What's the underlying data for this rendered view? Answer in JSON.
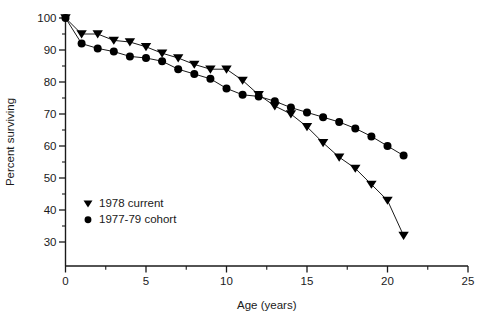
{
  "chart_data": {
    "type": "line",
    "title": "",
    "subtitle": "",
    "xlabel": "Age (years)",
    "ylabel": "Percent surviving",
    "xlim": [
      0,
      25
    ],
    "ylim": [
      25,
      100
    ],
    "grid": false,
    "legend_position": "inside-lower-left",
    "x_ticks_major": [
      0,
      5,
      10,
      15,
      20,
      25
    ],
    "x_tick_labels": [
      "0",
      "5",
      "10",
      "15",
      "20",
      "25"
    ],
    "x_ticks_minor": [
      1,
      2,
      3,
      4,
      6,
      7,
      8,
      9,
      11,
      12,
      13,
      14,
      16,
      17,
      18,
      19,
      21,
      22,
      23,
      24
    ],
    "y_ticks_major": [
      30,
      40,
      50,
      60,
      70,
      80,
      90,
      100
    ],
    "y_tick_labels": [
      "30",
      "40",
      "50",
      "60",
      "70",
      "80",
      "90",
      "100"
    ],
    "y_ticks_minor": [
      35,
      45,
      55,
      65,
      75,
      85,
      95
    ],
    "x": [
      0,
      1,
      2,
      3,
      4,
      5,
      6,
      7,
      8,
      9,
      10,
      11,
      12,
      13,
      14,
      15,
      16,
      17,
      18,
      19,
      20,
      21
    ],
    "series": [
      {
        "name": "1978 current",
        "marker": "triangle-down",
        "color": "#000000",
        "values": [
          100,
          95,
          95,
          93,
          92.5,
          91,
          89,
          87.5,
          85.5,
          84,
          84,
          80.5,
          76,
          72.5,
          70,
          66,
          61,
          56.5,
          53,
          48,
          43,
          32
        ]
      },
      {
        "name": "1977-79 cohort",
        "marker": "circle",
        "color": "#000000",
        "values": [
          100,
          92,
          90.5,
          89.5,
          88,
          87.5,
          86.5,
          84,
          82.5,
          81,
          78,
          76,
          75.5,
          74,
          72,
          70.5,
          69,
          67.5,
          65.5,
          63,
          60,
          57
        ]
      }
    ]
  },
  "legend": {
    "items": [
      {
        "label": "1978 current",
        "marker": "triangle-down"
      },
      {
        "label": "1977-79 cohort",
        "marker": "circle"
      }
    ]
  }
}
